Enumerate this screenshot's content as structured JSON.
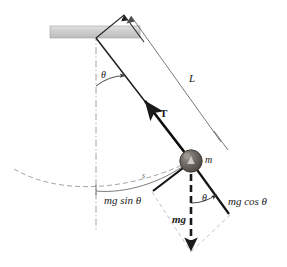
{
  "figure": {
    "background_color": "#ffffff",
    "ink_color": "#1a1a1a",
    "construction_color": "#9a9a9a",
    "ceiling_color": "#cfcfcf",
    "bob_color": "#6e6a66"
  },
  "labels": {
    "theta_top": "θ",
    "theta_bottom": "θ",
    "length": "L",
    "tension": "T",
    "mass": "m",
    "arc_length": "s",
    "mg_sin_theta": "mg sin θ",
    "mg_cos_theta": "mg cos θ",
    "weight": "mg"
  },
  "geometry": {
    "pivot": [
      96,
      38
    ],
    "bob_center": [
      191,
      161
    ],
    "bob_radius": 11,
    "ceiling": {
      "x": 50,
      "y": 26,
      "width": 90,
      "height": 12
    },
    "triangle_apex": [
      124,
      15
    ],
    "string_angle_deg": 37.7,
    "dimension_line": {
      "from": [
        131,
        16
      ],
      "to": [
        222,
        143
      ],
      "label": "L"
    },
    "vertical_axis_x": 96,
    "swing_arc_radius": 154
  },
  "vectors": [
    {
      "name": "tension",
      "label": "T",
      "from": [
        191,
        161
      ],
      "to": [
        143,
        99
      ],
      "style": "solid-bold",
      "color": "#1a1a1a"
    },
    {
      "name": "weight",
      "label": "mg",
      "from": [
        191,
        161
      ],
      "to": [
        191,
        255
      ],
      "style": "dashed-bold",
      "color": "#1a1a1a"
    },
    {
      "name": "mg-sin-theta",
      "label": "mg sin θ",
      "from": [
        191,
        161
      ],
      "to": [
        152,
        192
      ],
      "style": "solid-bold",
      "color": "#1a1a1a"
    },
    {
      "name": "mg-cos-theta",
      "label": "mg cos θ",
      "from": [
        191,
        161
      ],
      "to": [
        230,
        215
      ],
      "style": "solid-bold",
      "color": "#1a1a1a"
    }
  ],
  "annotations": {
    "swing_path": "dashed arc through the bob showing the pendulum path",
    "parallelogram": "light dashed construction lines completing the force parallelogram"
  }
}
